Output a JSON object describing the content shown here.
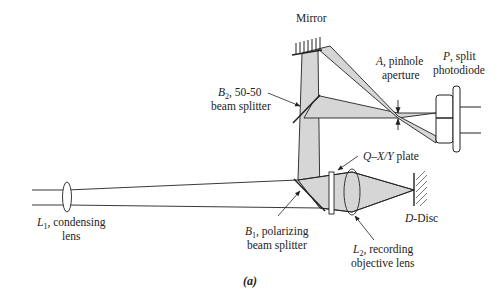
{
  "figure": {
    "caption": "(a)",
    "colors": {
      "beam_fill": "#d6d6d6",
      "line": "#222222",
      "background": "#ffffff"
    }
  },
  "labels": {
    "mirror": "Mirror",
    "b2": {
      "sym": "B",
      "sub": "2",
      "line1_rest": ", 50-50",
      "line2": "beam splitter"
    },
    "a": {
      "sym": "A",
      "line1_rest": ", pinhole",
      "line2": "aperture"
    },
    "p": {
      "sym": "P",
      "line1_rest": ", split",
      "line2": "photodiode"
    },
    "q": {
      "sym": "Q",
      "line1_rest": "–",
      "xy": "X/Y",
      "plate": " plate"
    },
    "l1": {
      "sym": "L",
      "sub": "1",
      "line1_rest": ", condensing",
      "line2": "lens"
    },
    "b1": {
      "sym": "B",
      "sub": "1",
      "line1_rest": ", polarizing",
      "line2": "beam splitter"
    },
    "l2": {
      "sym": "L",
      "sub": "2",
      "line1_rest": ", recording",
      "line2": "objective lens"
    },
    "d": {
      "sym": "D",
      "rest": "-Disc"
    }
  }
}
